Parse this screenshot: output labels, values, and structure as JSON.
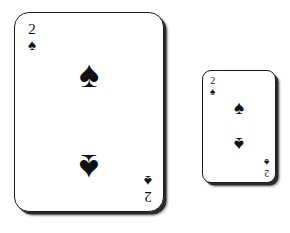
{
  "scene": {
    "description": "Two playing cards on a white background",
    "background_color": "#ffffff",
    "ink_color": "#111111",
    "border_color": "#1a1a1a",
    "shadow_color": "#2b2b2b"
  },
  "cards": [
    {
      "name": "two-of-spades-large",
      "rank": "2",
      "suit": "spades",
      "suit_symbol": "♠",
      "size_label": "large",
      "corner_index": {
        "top_left": {
          "rank": "2",
          "pip": "♠"
        },
        "bottom_right": {
          "rank": "2",
          "pip": "♠"
        }
      },
      "center_pips": [
        {
          "position": "upper",
          "symbol": "♠",
          "rotated": false
        },
        {
          "position": "lower",
          "symbol": "♠",
          "rotated": true
        }
      ]
    },
    {
      "name": "two-of-spades-small",
      "rank": "2",
      "suit": "spades",
      "suit_symbol": "♠",
      "size_label": "small",
      "corner_index": {
        "top_left": {
          "rank": "2",
          "pip": "♠"
        },
        "bottom_right": {
          "rank": "2",
          "pip": "♠"
        }
      },
      "center_pips": [
        {
          "position": "upper",
          "symbol": "♠",
          "rotated": false
        },
        {
          "position": "lower",
          "symbol": "♠",
          "rotated": true
        }
      ]
    }
  ]
}
